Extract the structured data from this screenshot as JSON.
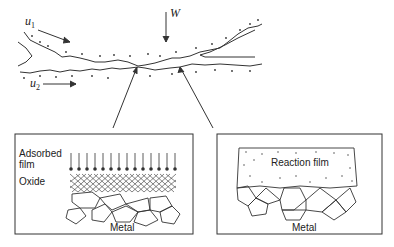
{
  "diagram": {
    "type": "boundary lubrication contact schematic",
    "top": {
      "load_label": "W",
      "velocity_upper": {
        "symbol": "u",
        "subscript": "1"
      },
      "velocity_lower": {
        "symbol": "u",
        "subscript": "2"
      }
    },
    "left_panel": {
      "labels": {
        "adsorbed_film": "Adsorbed film",
        "oxide": "Oxide",
        "metal": "Metal"
      }
    },
    "right_panel": {
      "labels": {
        "reaction_film": "Reaction film",
        "metal": "Metal"
      }
    },
    "colors": {
      "stroke": "#333333",
      "background": "#ffffff"
    }
  }
}
